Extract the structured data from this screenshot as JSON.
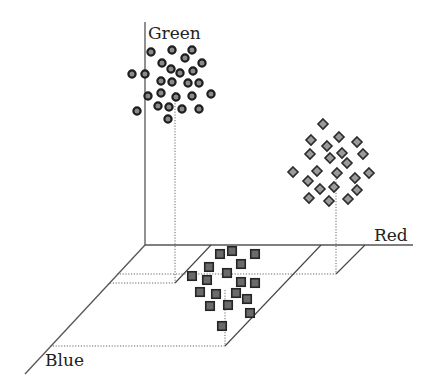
{
  "diagram": {
    "type": "3d-color-space-scatter",
    "axes": {
      "green": {
        "label": "Green"
      },
      "red": {
        "label": "Red"
      },
      "blue": {
        "label": "Blue"
      }
    },
    "colors": {
      "axis": "#555555",
      "circle_fill": "#8a8a8a",
      "diamond_fill": "#9a9a9a",
      "square_fill": "#6a6a6a",
      "marker_stroke": "#222222"
    },
    "clusters": [
      {
        "name": "green-cluster",
        "marker": "circle",
        "points": [
          [
            151,
            52
          ],
          [
            172,
            50
          ],
          [
            192,
            50
          ],
          [
            162,
            63
          ],
          [
            185,
            58
          ],
          [
            202,
            63
          ],
          [
            132,
            74
          ],
          [
            145,
            74
          ],
          [
            171,
            69
          ],
          [
            180,
            73
          ],
          [
            193,
            71
          ],
          [
            161,
            81
          ],
          [
            172,
            82
          ],
          [
            188,
            83
          ],
          [
            199,
            83
          ],
          [
            148,
            96
          ],
          [
            161,
            93
          ],
          [
            176,
            97
          ],
          [
            192,
            96
          ],
          [
            211,
            94
          ],
          [
            137,
            111
          ],
          [
            158,
            106
          ],
          [
            169,
            107
          ],
          [
            182,
            109
          ],
          [
            199,
            109
          ],
          [
            168,
            119
          ]
        ]
      },
      {
        "name": "red-cluster",
        "marker": "diamond",
        "points": [
          [
            323,
            124
          ],
          [
            311,
            140
          ],
          [
            339,
            137
          ],
          [
            357,
            142
          ],
          [
            327,
            146
          ],
          [
            310,
            154
          ],
          [
            330,
            158
          ],
          [
            342,
            153
          ],
          [
            363,
            154
          ],
          [
            347,
            163
          ],
          [
            293,
            172
          ],
          [
            317,
            171
          ],
          [
            337,
            173
          ],
          [
            355,
            178
          ],
          [
            369,
            173
          ],
          [
            308,
            181
          ],
          [
            320,
            189
          ],
          [
            334,
            187
          ],
          [
            357,
            190
          ],
          [
            309,
            198
          ],
          [
            329,
            201
          ],
          [
            348,
            199
          ]
        ]
      },
      {
        "name": "blue-cluster",
        "marker": "square",
        "points": [
          [
            220,
            254
          ],
          [
            232,
            251
          ],
          [
            255,
            254
          ],
          [
            209,
            267
          ],
          [
            241,
            264
          ],
          [
            192,
            276
          ],
          [
            227,
            273
          ],
          [
            207,
            280
          ],
          [
            241,
            282
          ],
          [
            255,
            283
          ],
          [
            200,
            292
          ],
          [
            216,
            294
          ],
          [
            236,
            293
          ],
          [
            247,
            299
          ],
          [
            210,
            306
          ],
          [
            228,
            305
          ],
          [
            250,
            313
          ],
          [
            222,
            326
          ]
        ]
      }
    ]
  }
}
